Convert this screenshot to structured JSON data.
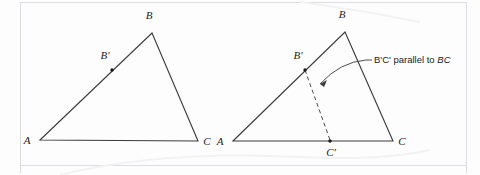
{
  "figure": {
    "background_color": "#fdfdfd",
    "ink_color": "#3a3a3a",
    "frame_color": "#dcdce2",
    "annotation": {
      "text_plain": "B'C' parallel to ",
      "text_emphasis": "BC",
      "full_text": "B'C' parallel to BC"
    },
    "left_triangle": {
      "name": "original-triangle",
      "vertices": {
        "A": {
          "label": "A",
          "x": 40,
          "y": 140
        },
        "B": {
          "label": "B",
          "x": 152,
          "y": 33
        },
        "C": {
          "label": "C",
          "x": 198,
          "y": 141
        }
      },
      "marked_points": {
        "B_prime": {
          "label": "B'",
          "x": 112,
          "y": 70
        }
      }
    },
    "right_triangle": {
      "name": "constructed-triangle",
      "vertices": {
        "A": {
          "label": "A",
          "x": 233,
          "y": 141
        },
        "B": {
          "label": "B",
          "x": 345,
          "y": 32
        },
        "C": {
          "label": "C",
          "x": 393,
          "y": 141
        }
      },
      "marked_points": {
        "B_prime": {
          "label": "B'",
          "x": 305,
          "y": 70
        },
        "C_prime": {
          "label": "C'",
          "x": 330,
          "y": 141
        }
      },
      "dashed_segment": {
        "from": "B'",
        "to": "C'"
      }
    }
  }
}
